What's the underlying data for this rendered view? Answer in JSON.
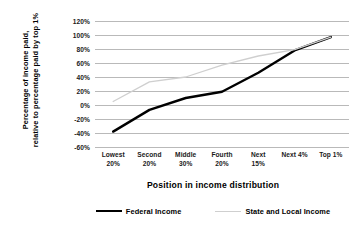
{
  "chart_data": {
    "type": "line",
    "title": "",
    "xlabel": "Position in income distribution",
    "ylabel": "Percentage of income paid, relative to percentage paid by top 1%",
    "ylabel_line1": "Percentage of income paid,",
    "ylabel_line2": "relative to percentage paid by top 1%",
    "categories": [
      "Lowest 20%",
      "Second 20%",
      "Middle 30%",
      "Fourth 20%",
      "Next 15%",
      "Next 4%",
      "Top 1%"
    ],
    "category_lines": [
      {
        "line1": "Lowest",
        "line2": "20%"
      },
      {
        "line1": "Second",
        "line2": "20%"
      },
      {
        "line1": "Middle",
        "line2": "30%"
      },
      {
        "line1": "Fourth",
        "line2": "20%"
      },
      {
        "line1": "Next",
        "line2": "15%"
      },
      {
        "line1": "Next 4%",
        "line2": ""
      },
      {
        "line1": "Top 1%",
        "line2": ""
      }
    ],
    "ylim": [
      -60,
      120
    ],
    "ytick_step": 20,
    "ytick_labels": [
      "120%",
      "100%",
      "80%",
      "60%",
      "40%",
      "20%",
      "0%",
      "-20%",
      "-40%",
      "-60%"
    ],
    "ytick_values": [
      120,
      100,
      80,
      60,
      40,
      20,
      0,
      -20,
      -40,
      -60
    ],
    "grid": true,
    "grid_color": "#b9b9b9",
    "legend_position": "bottom",
    "series": [
      {
        "name": "Federal Income",
        "color": "#000000",
        "width": 2.4,
        "values": [
          -38,
          -7,
          10,
          19,
          46,
          78,
          97
        ]
      },
      {
        "name": "State and Local Income",
        "color": "#cfcfcf",
        "width": 1.3,
        "values": [
          5,
          33,
          40,
          57,
          70,
          79,
          97
        ]
      }
    ]
  },
  "legend": {
    "entries": [
      {
        "label": "Federal Income"
      },
      {
        "label": "State and Local Income"
      }
    ]
  }
}
